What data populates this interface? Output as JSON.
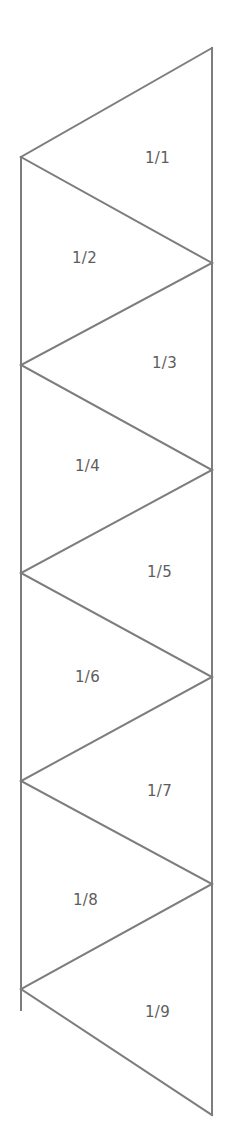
{
  "diagram": {
    "type": "triangle-strip",
    "background_color": "#ffffff",
    "stroke_color": "#7d7d7d",
    "label_color": "#5d5d5d",
    "stroke_width": 2,
    "canvas": {
      "width": 226,
      "height": 1144
    },
    "geometry": {
      "right_edge_x": 212,
      "left_edge_x": 21,
      "right_vertices_y": [
        48,
        263,
        470,
        677,
        884,
        1115
      ],
      "left_vertices_y": [
        157,
        365,
        573,
        781,
        989
      ]
    },
    "triangles": [
      {
        "label": "1/1",
        "side": "right",
        "label_x": 145,
        "label_y": 151
      },
      {
        "label": "1/2",
        "side": "left",
        "label_x": 72,
        "label_y": 251
      },
      {
        "label": "1/3",
        "side": "right",
        "label_x": 152,
        "label_y": 356
      },
      {
        "label": "1/4",
        "side": "left",
        "label_x": 75,
        "label_y": 459
      },
      {
        "label": "1/5",
        "side": "right",
        "label_x": 147,
        "label_y": 565
      },
      {
        "label": "1/6",
        "side": "left",
        "label_x": 75,
        "label_y": 670
      },
      {
        "label": "1/7",
        "side": "right",
        "label_x": 147,
        "label_y": 784
      },
      {
        "label": "1/8",
        "side": "left",
        "label_x": 73,
        "label_y": 893
      },
      {
        "label": "1/9",
        "side": "right",
        "label_x": 145,
        "label_y": 1005
      }
    ],
    "paths": {
      "right_edge": "M 212 48 L 212 1115",
      "left_edge": "M 21 157 L 21 1010",
      "zigzag": "M 212 48 L 21 157 L 212 263 L 21 365 L 212 470 L 21 573 L 212 677 L 21 781 L 212 884 L 21 989 L 212 1115"
    }
  }
}
